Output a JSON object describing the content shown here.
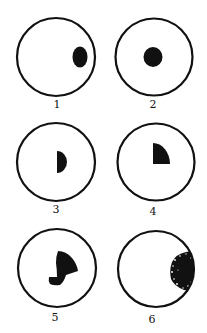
{
  "figure": {
    "panels": [
      {
        "label": "1",
        "description": "oval spot near right edge"
      },
      {
        "label": "2",
        "description": "round spot at center"
      },
      {
        "label": "3",
        "description": "half-disc spot at center"
      },
      {
        "label": "4",
        "description": "quarter-disc spot at center"
      },
      {
        "label": "5",
        "description": "irregular spot at center"
      },
      {
        "label": "6",
        "description": "speckled crescent spot at right edge"
      }
    ]
  },
  "colors": {
    "ink": "#111111",
    "background": "#ffffff"
  }
}
